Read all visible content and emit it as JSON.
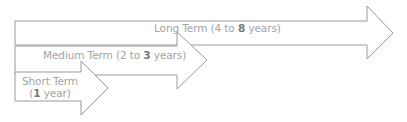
{
  "diagram": {
    "type": "stacked-arrows-timeline",
    "stroke_color": "#9a9a9a",
    "text_color": "#a3a3a3",
    "arrows": [
      {
        "id": "long",
        "label_prefix": "Long Term (4 to ",
        "label_bold": "8",
        "label_suffix": " years)"
      },
      {
        "id": "medium",
        "label_prefix": "Medium Term (2 to ",
        "label_bold": "3",
        "label_suffix": " years)"
      },
      {
        "id": "short",
        "label_line1": "Short Term",
        "label_line2_prefix": "(",
        "label_line2_bold": "1",
        "label_line2_suffix": " year)"
      }
    ]
  }
}
